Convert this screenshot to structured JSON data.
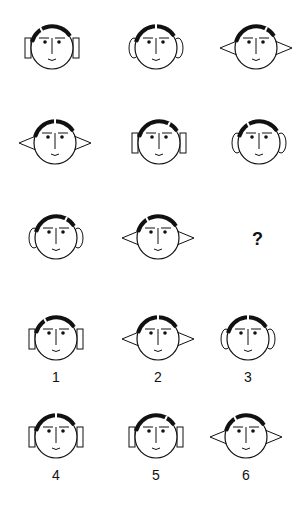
{
  "puzzle": {
    "question_mark": "?",
    "grid": [
      {
        "row": 1,
        "col": 1,
        "hair": "left-notch",
        "ears": "rectangle",
        "cx": 52,
        "cy": 48
      },
      {
        "row": 1,
        "col": 2,
        "hair": "center-part",
        "ears": "oval",
        "cx": 156,
        "cy": 48
      },
      {
        "row": 1,
        "col": 3,
        "hair": "right-notch",
        "ears": "triangle",
        "cx": 256,
        "cy": 48
      },
      {
        "row": 2,
        "col": 1,
        "hair": "center-part",
        "ears": "triangle",
        "cx": 55,
        "cy": 143
      },
      {
        "row": 2,
        "col": 2,
        "hair": "right-notch",
        "ears": "rectangle",
        "cx": 159,
        "cy": 143
      },
      {
        "row": 2,
        "col": 3,
        "hair": "left-notch",
        "ears": "oval",
        "cx": 259,
        "cy": 143
      },
      {
        "row": 3,
        "col": 1,
        "hair": "right-notch",
        "ears": "oval",
        "cx": 56,
        "cy": 238
      },
      {
        "row": 3,
        "col": 2,
        "hair": "left-notch",
        "ears": "triangle",
        "cx": 158,
        "cy": 238
      }
    ],
    "options": [
      {
        "label": "1",
        "hair": "left-notch",
        "ears": "rectangle",
        "cx": 56,
        "cy": 339
      },
      {
        "label": "2",
        "hair": "center-part",
        "ears": "triangle",
        "cx": 158,
        "cy": 339
      },
      {
        "label": "3",
        "hair": "center-part",
        "ears": "oval",
        "cx": 248,
        "cy": 339
      },
      {
        "label": "4",
        "hair": "center-part",
        "ears": "rectangle",
        "cx": 56,
        "cy": 437
      },
      {
        "label": "5",
        "hair": "right-notch",
        "ears": "rectangle",
        "cx": 156,
        "cy": 437
      },
      {
        "label": "6",
        "hair": "left-notch",
        "ears": "triangle",
        "cx": 246,
        "cy": 437
      }
    ]
  },
  "colors": {
    "stroke": "#111111",
    "background": "#ffffff"
  }
}
